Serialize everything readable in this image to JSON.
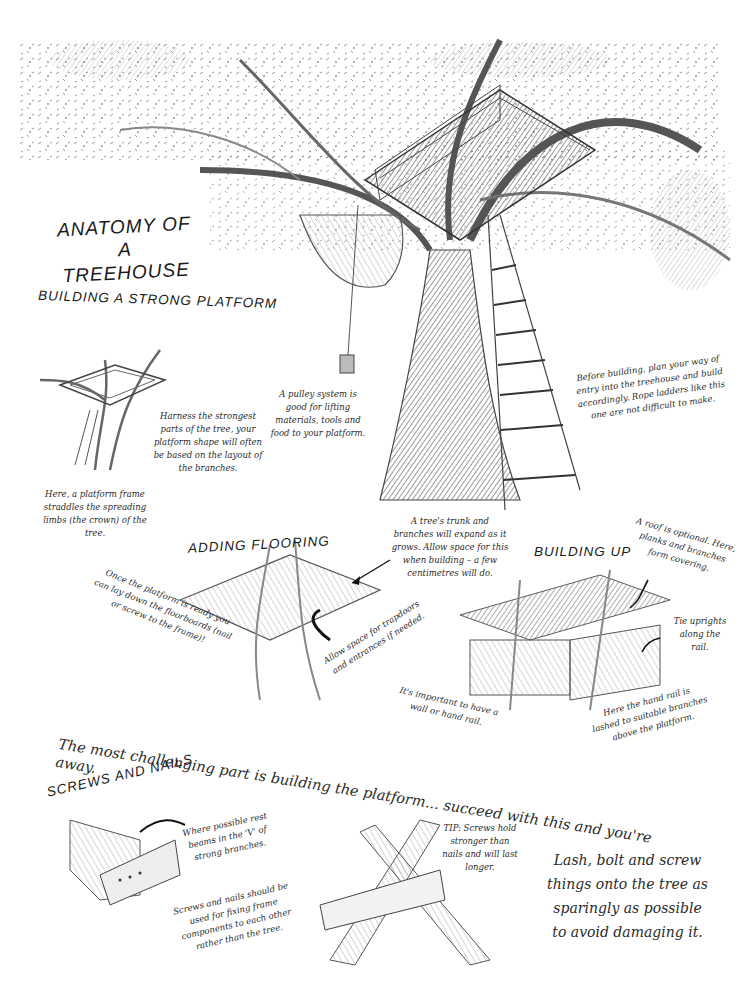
{
  "title": {
    "line1": "Anatomy of a",
    "line2": "Treehouse"
  },
  "sections": {
    "platform": {
      "heading": "Building a strong platform",
      "notes": {
        "harness": "Harness the strongest parts of the tree, your platform shape will often be based on the layout of the branches.",
        "frame": "Here, a platform frame straddles the spreading limbs (the crown) of the tree."
      }
    },
    "main_tree": {
      "notes": {
        "pulley": "A pulley system is good for lifting materials, tools and food to your platform.",
        "entry": "Before building, plan your way of entry into the treehouse and build accordingly. Rope ladders like this one are not difficult to make."
      }
    },
    "flooring": {
      "heading": "Adding flooring",
      "notes": {
        "floorboards": "Once the platform is ready you can lay down the floorboards (nail or screw to the frame)!",
        "expand": "A tree's trunk and branches will expand as it grows. Allow space for this when building – a few centimetres will do.",
        "trapdoors": "Allow space for trapdoors and entrances if needed."
      }
    },
    "building_up": {
      "heading": "Building up",
      "notes": {
        "roof": "A roof is optional. Here, planks and branches form covering.",
        "uprights": "Tie uprights along the rail.",
        "wall": "It's important to have a wall or hand rail.",
        "handrail": "Here the hand rail is lashed to suitable branches above the platform."
      }
    },
    "banner": "The most challenging part is building the platform... succeed with this and you're away.",
    "screws": {
      "heading": "Screws and nails",
      "notes": {
        "rest_beams": "Where possible rest beams in the 'V' of strong branches.",
        "fixing": "Screws and nails should be used for fixing frame components to each other rather than the tree.",
        "tip": "TIP: Screws hold stronger than nails and will last longer.",
        "lash": "Lash, bolt and screw things onto the tree as sparingly as possible to avoid damaging it."
      }
    }
  },
  "colors": {
    "ink": "#1e1e1e",
    "pencil": "#6b6b6b",
    "shade": "#3a3a3a",
    "paper": "#ffffff"
  }
}
